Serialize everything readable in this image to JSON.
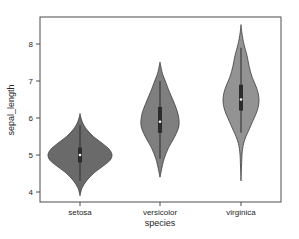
{
  "chart_data": {
    "type": "violin",
    "title": "",
    "xlabel": "species",
    "ylabel": "sepal_length",
    "categories": [
      "setosa",
      "versicolor",
      "virginica"
    ],
    "yticks": [
      4,
      5,
      6,
      7,
      8
    ],
    "ylim": [
      3.75,
      8.75
    ],
    "grid": false,
    "legend": null,
    "series": [
      {
        "name": "setosa",
        "fill": "#6a6a6a",
        "kde_min": 3.9,
        "kde_max": 6.1,
        "whisker_low": 4.3,
        "whisker_high": 5.8,
        "q1": 4.8,
        "median": 5.0,
        "q3": 5.2,
        "profile": [
          [
            3.9,
            0.0
          ],
          [
            4.1,
            0.06
          ],
          [
            4.3,
            0.2
          ],
          [
            4.5,
            0.42
          ],
          [
            4.7,
            0.72
          ],
          [
            4.85,
            0.93
          ],
          [
            5.0,
            1.0
          ],
          [
            5.15,
            0.92
          ],
          [
            5.3,
            0.72
          ],
          [
            5.5,
            0.42
          ],
          [
            5.7,
            0.2
          ],
          [
            5.9,
            0.07
          ],
          [
            6.1,
            0.0
          ]
        ]
      },
      {
        "name": "versicolor",
        "fill": "#7f7f7f",
        "kde_min": 4.4,
        "kde_max": 7.5,
        "whisker_low": 4.9,
        "whisker_high": 7.0,
        "q1": 5.6,
        "median": 5.9,
        "q3": 6.3,
        "profile": [
          [
            4.4,
            0.0
          ],
          [
            4.6,
            0.08
          ],
          [
            4.9,
            0.22
          ],
          [
            5.2,
            0.45
          ],
          [
            5.5,
            0.78
          ],
          [
            5.8,
            1.0
          ],
          [
            6.1,
            0.95
          ],
          [
            6.4,
            0.75
          ],
          [
            6.7,
            0.5
          ],
          [
            7.0,
            0.28
          ],
          [
            7.2,
            0.13
          ],
          [
            7.4,
            0.04
          ],
          [
            7.5,
            0.0
          ]
        ]
      },
      {
        "name": "virginica",
        "fill": "#939393",
        "kde_min": 4.3,
        "kde_max": 8.5,
        "whisker_low": 5.6,
        "whisker_high": 7.9,
        "q1": 6.2,
        "median": 6.5,
        "q3": 6.9,
        "profile": [
          [
            4.3,
            0.0
          ],
          [
            4.7,
            0.03
          ],
          [
            5.1,
            0.07
          ],
          [
            5.4,
            0.2
          ],
          [
            5.8,
            0.55
          ],
          [
            6.2,
            0.9
          ],
          [
            6.5,
            1.0
          ],
          [
            6.8,
            0.88
          ],
          [
            7.1,
            0.62
          ],
          [
            7.4,
            0.45
          ],
          [
            7.7,
            0.33
          ],
          [
            8.0,
            0.16
          ],
          [
            8.3,
            0.05
          ],
          [
            8.5,
            0.0
          ]
        ]
      }
    ]
  },
  "style": {
    "edge_color": "#3d3d3d",
    "box_color": "#2b2b2b",
    "median_color": "#ffffff",
    "axis_color": "#4d4d4d"
  }
}
